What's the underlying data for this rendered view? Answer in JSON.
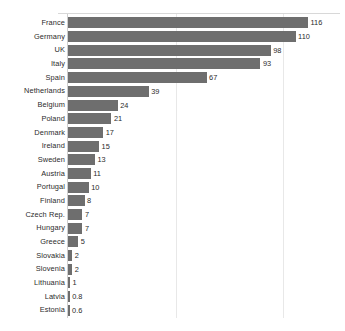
{
  "chart_data": {
    "type": "bar",
    "orientation": "horizontal",
    "title": "",
    "subtitle": "",
    "xlabel": "",
    "ylabel": "",
    "xlim": [
      0,
      116
    ],
    "grid": true,
    "gridlines": [
      52,
      104
    ],
    "legend": "none",
    "bar_color": "#6e6e6e",
    "label_color": "#2b2b2b",
    "gridline_color": "#e8e8e8",
    "axis_color": "#cfcfcf",
    "categories": [
      "France",
      "Germany",
      "UK",
      "Italy",
      "Spain",
      "Netherlands",
      "Belgium",
      "Poland",
      "Denmark",
      "Ireland",
      "Sweden",
      "Austria",
      "Portugal",
      "Finland",
      "Czech Rep.",
      "Hungary",
      "Greece",
      "Slovakia",
      "Slovenia",
      "Lithuania",
      "Latvia",
      "Estonia"
    ],
    "values": [
      116,
      110,
      98,
      93,
      67,
      39,
      24,
      21,
      17,
      15,
      13,
      11,
      10,
      8,
      7,
      7,
      5,
      2,
      2,
      1,
      0.8,
      0.6
    ],
    "value_labels": [
      "116",
      "110",
      "98",
      "93",
      "67",
      "39",
      "24",
      "21",
      "17",
      "15",
      "13",
      "11",
      "10",
      "8",
      "7",
      "7",
      "5",
      "2",
      "2",
      "1",
      "0.8",
      "0.6"
    ],
    "rows": [
      {
        "label": "France",
        "value": 116,
        "value_label": "116"
      },
      {
        "label": "Germany",
        "value": 110,
        "value_label": "110"
      },
      {
        "label": "UK",
        "value": 98,
        "value_label": "98"
      },
      {
        "label": "Italy",
        "value": 93,
        "value_label": "93"
      },
      {
        "label": "Spain",
        "value": 67,
        "value_label": "67"
      },
      {
        "label": "Netherlands",
        "value": 39,
        "value_label": "39"
      },
      {
        "label": "Belgium",
        "value": 24,
        "value_label": "24"
      },
      {
        "label": "Poland",
        "value": 21,
        "value_label": "21"
      },
      {
        "label": "Denmark",
        "value": 17,
        "value_label": "17"
      },
      {
        "label": "Ireland",
        "value": 15,
        "value_label": "15"
      },
      {
        "label": "Sweden",
        "value": 13,
        "value_label": "13"
      },
      {
        "label": "Austria",
        "value": 11,
        "value_label": "11"
      },
      {
        "label": "Portugal",
        "value": 10,
        "value_label": "10"
      },
      {
        "label": "Finland",
        "value": 8,
        "value_label": "8"
      },
      {
        "label": "Czech Rep.",
        "value": 7,
        "value_label": "7"
      },
      {
        "label": "Hungary",
        "value": 7,
        "value_label": "7"
      },
      {
        "label": "Greece",
        "value": 5,
        "value_label": "5"
      },
      {
        "label": "Slovakia",
        "value": 2,
        "value_label": "2"
      },
      {
        "label": "Slovenia",
        "value": 2,
        "value_label": "2"
      },
      {
        "label": "Lithuania",
        "value": 1,
        "value_label": "1"
      },
      {
        "label": "Latvia",
        "value": 0.8,
        "value_label": "0.8"
      },
      {
        "label": "Estonia",
        "value": 0.6,
        "value_label": "0.6"
      }
    ]
  }
}
